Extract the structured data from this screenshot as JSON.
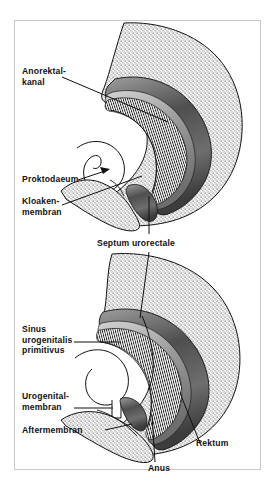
{
  "figure": {
    "background_color": "#ffffff",
    "frame_color": "#c9c9c9",
    "ink_color": "#111111",
    "stipple_color": "#2b2b2b",
    "band_dark_color": "#5a5a5a",
    "band_mid_color": "#8d8d8d",
    "band_light_color": "#c4c4c4"
  },
  "panels": [
    {
      "name": "upper-panel",
      "stage": "Frühstadium mit Kloakenmembran",
      "labels": [
        {
          "id": "anorektalkanal",
          "lines": [
            "Anorektal-",
            "kanal"
          ],
          "leader": "line"
        },
        {
          "id": "proktodaeum",
          "lines": [
            "Proktodaeum"
          ],
          "leader": "arrow"
        },
        {
          "id": "kloakenmembran",
          "lines": [
            "Kloaken-",
            "membran"
          ],
          "leader": "line"
        }
      ]
    },
    {
      "name": "shared-label",
      "labels": [
        {
          "id": "septum-urorectale",
          "lines": [
            "Septum urorectale"
          ],
          "leader": "line"
        }
      ]
    },
    {
      "name": "lower-panel",
      "stage": "Spätstadium nach Septierung",
      "labels": [
        {
          "id": "sinus-urogenitalis-primitivus",
          "lines": [
            "Sinus",
            "urogenitalis",
            "primitivus"
          ],
          "leader": "line"
        },
        {
          "id": "urogenitalmembran",
          "lines": [
            "Urogenital-",
            "membran"
          ],
          "leader": "line"
        },
        {
          "id": "aftermembran",
          "lines": [
            "Aftermembran"
          ],
          "leader": "line"
        },
        {
          "id": "rektum",
          "lines": [
            "Rektum"
          ],
          "leader": "line"
        },
        {
          "id": "anus",
          "lines": [
            "Anus"
          ],
          "leader": "line"
        }
      ]
    }
  ],
  "text": {
    "anorektalkanal_l1": "Anorektal-",
    "anorektalkanal_l2": "kanal",
    "proktodaeum": "Proktodaeum",
    "kloakenmembran_l1": "Kloaken-",
    "kloakenmembran_l2": "membran",
    "septum_urorectale": "Septum urorectale",
    "sinus_l1": "Sinus",
    "sinus_l2": "urogenitalis",
    "sinus_l3": "primitivus",
    "urogenitalmembran_l1": "Urogenital-",
    "urogenitalmembran_l2": "membran",
    "aftermembran": "Aftermembran",
    "rektum": "Rektum",
    "anus": "Anus"
  }
}
